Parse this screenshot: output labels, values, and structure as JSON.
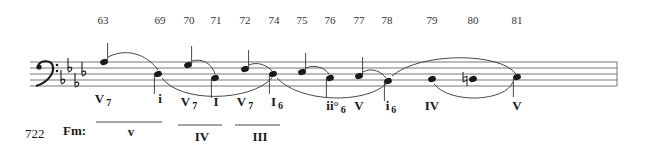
{
  "example_number": "722",
  "key_label": "Fm:",
  "clef": "bass",
  "key_signature": {
    "accidental": "flat",
    "count": 4
  },
  "measure_numbers": [
    {
      "label": "63",
      "x": 103
    },
    {
      "label": "69",
      "x": 160
    },
    {
      "label": "70",
      "x": 189
    },
    {
      "label": "71",
      "x": 216
    },
    {
      "label": "72",
      "x": 245
    },
    {
      "label": "74",
      "x": 274
    },
    {
      "label": "75",
      "x": 302
    },
    {
      "label": "76",
      "x": 330
    },
    {
      "label": "77",
      "x": 359
    },
    {
      "label": "78",
      "x": 387
    },
    {
      "label": "79",
      "x": 432
    },
    {
      "label": "80",
      "x": 473
    },
    {
      "label": "81",
      "x": 517
    }
  ],
  "notes": [
    {
      "measure": "63",
      "x": 104,
      "y": 62,
      "stem": "up"
    },
    {
      "measure": "69",
      "x": 158,
      "y": 74,
      "stem": "down"
    },
    {
      "measure": "70",
      "x": 188,
      "y": 65,
      "stem": "up"
    },
    {
      "measure": "71",
      "x": 215,
      "y": 78,
      "stem": "down"
    },
    {
      "measure": "72",
      "x": 245,
      "y": 69,
      "stem": "up"
    },
    {
      "measure": "74",
      "x": 273,
      "y": 74,
      "stem": "down"
    },
    {
      "measure": "75",
      "x": 302,
      "y": 72,
      "stem": "up"
    },
    {
      "measure": "76",
      "x": 330,
      "y": 78,
      "stem": "down"
    },
    {
      "measure": "77",
      "x": 359,
      "y": 76,
      "stem": "up"
    },
    {
      "measure": "78",
      "x": 388,
      "y": 81,
      "stem": "down"
    },
    {
      "measure": "79",
      "x": 432,
      "y": 79,
      "stem": "none"
    },
    {
      "measure": "80",
      "x": 473,
      "y": 79,
      "stem": "none",
      "accidental": "natural"
    },
    {
      "measure": "81",
      "x": 517,
      "y": 77,
      "stem": "down"
    }
  ],
  "roman_numerals": [
    {
      "text": "V",
      "sub": "7",
      "x": 103,
      "y": 103
    },
    {
      "text": "i",
      "sub": "",
      "x": 160,
      "y": 103
    },
    {
      "text": "V",
      "sub": "7",
      "x": 189,
      "y": 106
    },
    {
      "text": "I",
      "sub": "",
      "x": 216,
      "y": 106
    },
    {
      "text": "V",
      "sub": "7",
      "x": 245,
      "y": 106
    },
    {
      "text": "I",
      "sub": "6",
      "x": 277,
      "y": 106
    },
    {
      "text": "ii°",
      "sub": "6",
      "x": 336,
      "y": 110
    },
    {
      "text": "V",
      "sub": "",
      "x": 359,
      "y": 110
    },
    {
      "text": "i",
      "sub": "6",
      "x": 391,
      "y": 110
    },
    {
      "text": "IV",
      "sub": "",
      "x": 432,
      "y": 110
    },
    {
      "text": "V",
      "sub": "",
      "x": 517,
      "y": 110
    }
  ],
  "secondary_targets": [
    {
      "text": "v",
      "x": 131,
      "y": 122
    },
    {
      "text": "IV",
      "x": 202,
      "y": 127
    },
    {
      "text": "III",
      "x": 260,
      "y": 127
    }
  ],
  "colors": {
    "ink": "#1a1a1a",
    "staff": "#555555"
  }
}
